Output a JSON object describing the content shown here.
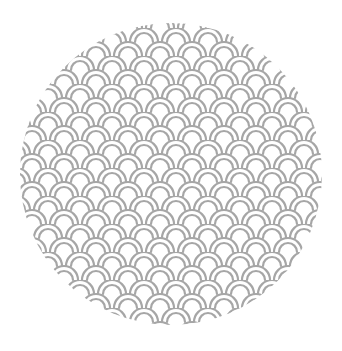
{
  "image": {
    "description": "Circular swatch filled with a seigaiha (overlapping wave arcs) pattern",
    "shape": "circle",
    "pattern": "seigaiha-waves",
    "colors": {
      "background": "#ffffff",
      "circle_fill": "#ffffff",
      "arc_stroke": "#a6a6a6"
    }
  }
}
